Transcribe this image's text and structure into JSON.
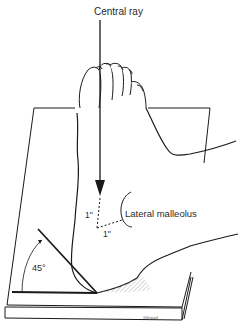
{
  "figure": {
    "labels": {
      "central_ray": "Central ray",
      "lateral_malleolus": "Lateral malleolus",
      "offset_vertical": "1''",
      "offset_horizontal": "1''",
      "angle": "45°",
      "artist_signature": "Sibstad"
    },
    "colors": {
      "line": "#1a1a1a",
      "background": "#ffffff",
      "hatch": "#9a9a9a"
    },
    "elements": [
      "central-ray-arrow",
      "foot",
      "leg",
      "cassette-board",
      "angle-sponge-45",
      "lateral-malleolus-marker"
    ]
  }
}
